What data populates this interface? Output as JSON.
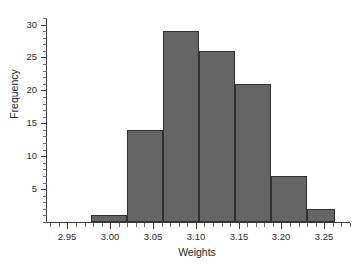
{
  "chart_data": {
    "type": "bar",
    "title": "",
    "subtitle": "",
    "xlabel": "Weights",
    "ylabel": "Frequency",
    "orientation": "vertical",
    "grid": false,
    "legend": false,
    "legend_position": "none",
    "xlim": [
      2.925,
      3.28
    ],
    "ylim": [
      0,
      31
    ],
    "xtick_labels": [
      "2.95",
      "3.00",
      "3.05",
      "3.10",
      "3.15",
      "3.20",
      "3.25"
    ],
    "xtick_values": [
      2.95,
      3.0,
      3.05,
      3.1,
      3.15,
      3.2,
      3.25
    ],
    "xtick_minor_step": 0.01,
    "ytick_labels": [
      "5",
      "10",
      "15",
      "20",
      "25",
      "30"
    ],
    "ytick_values": [
      5,
      10,
      15,
      20,
      25,
      30
    ],
    "ytick_minor_step": 1,
    "bin_width": 0.042,
    "bin_left_edges": [
      2.978,
      3.02,
      3.062,
      3.104,
      3.146,
      3.188,
      3.23
    ],
    "bin_right_edges": [
      3.02,
      3.062,
      3.104,
      3.146,
      3.188,
      3.23,
      3.262
    ],
    "categories": [
      "2.978-3.020",
      "3.020-3.062",
      "3.062-3.104",
      "3.104-3.146",
      "3.146-3.188",
      "3.188-3.230",
      "3.230-3.262"
    ],
    "values": [
      1,
      14,
      29,
      26,
      21,
      7,
      2
    ],
    "total_count": 100,
    "bar_fill_color": "#656565",
    "bar_edge_color": "#303030",
    "axis_color": "#3a3a3a",
    "text_color": "#1e1e1e",
    "background_color": "#ffffff"
  }
}
